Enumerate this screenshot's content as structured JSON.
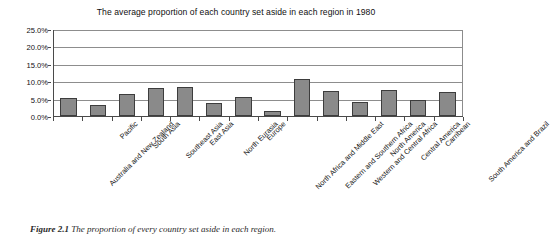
{
  "chart_data": {
    "type": "bar",
    "title": "The average proportion of each country set aside in each region in 1980",
    "xlabel": "",
    "ylabel": "",
    "ylim": [
      0,
      25
    ],
    "ytick_labels": [
      "25.0%",
      "20.0%",
      "15.0%",
      "10.0%",
      "5.0%",
      "0.0%"
    ],
    "ytick_values": [
      25,
      20,
      15,
      10,
      5,
      0
    ],
    "grid": true,
    "legend": "none",
    "units": "percent",
    "categories": [
      "Australia and New Zealand",
      "Pacific",
      "South Asia",
      "Southeast Asia",
      "East Asia",
      "North Eurasia",
      "Europe",
      "North Africa and Middle East",
      "Eastern and Southern Africa",
      "Western and Central Africa",
      "North America",
      "Central America",
      "Carribean",
      "South America and Brazil"
    ],
    "values": [
      5.3,
      3.1,
      6.5,
      8.0,
      8.5,
      3.7,
      5.6,
      1.5,
      10.7,
      7.2,
      4.0,
      7.6,
      4.8,
      6.9
    ],
    "bar_color": "#8a8a8a",
    "bar_edge_color": "#3d3d3d"
  },
  "caption": {
    "label": "Figure 2.1",
    "text": "The proportion of every country set aside in each region."
  }
}
